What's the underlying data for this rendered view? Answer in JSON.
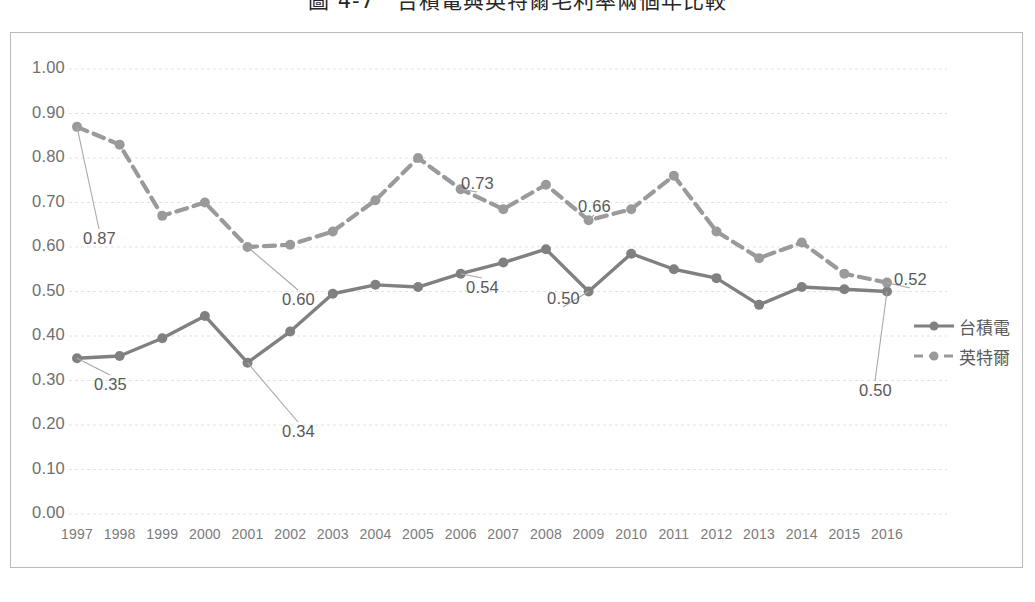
{
  "figure": {
    "title": "圖 4-7　台積電與英特爾毛利率兩個年比較"
  },
  "legend": {
    "position": "right",
    "items": [
      {
        "label": "台積電",
        "style": "solid",
        "color": "#808080"
      },
      {
        "label": "英特爾",
        "style": "dashed",
        "color": "#9a9a9a"
      }
    ]
  },
  "axes": {
    "y_ticks": [
      "1.00",
      "0.90",
      "0.80",
      "0.70",
      "0.60",
      "0.50",
      "0.40",
      "0.30",
      "0.20",
      "0.10",
      "0.00"
    ],
    "x_ticks": [
      "1997",
      "1998",
      "1999",
      "2000",
      "2001",
      "2002",
      "2003",
      "2004",
      "2005",
      "2006",
      "2007",
      "2008",
      "2009",
      "2010",
      "2011",
      "2012",
      "2013",
      "2014",
      "2015",
      "2016"
    ]
  },
  "annotations": [
    {
      "text": "0.87",
      "series": "英特爾",
      "year": "1997",
      "x": 72,
      "y": 196
    },
    {
      "text": "0.35",
      "series": "台積電",
      "year": "1997",
      "x": 83,
      "y": 342
    },
    {
      "text": "0.60",
      "series": "英特爾",
      "year": "2001",
      "x": 271,
      "y": 257
    },
    {
      "text": "0.34",
      "series": "台積電",
      "year": "2001",
      "x": 271,
      "y": 389
    },
    {
      "text": "0.73",
      "series": "英特爾",
      "year": "2006",
      "x": 450,
      "y": 141
    },
    {
      "text": "0.54",
      "series": "台積電",
      "year": "2006",
      "x": 455,
      "y": 245
    },
    {
      "text": "0.66",
      "series": "英特爾",
      "year": "2009",
      "x": 567,
      "y": 164
    },
    {
      "text": "0.50",
      "series": "台積電",
      "year": "2009",
      "x": 536,
      "y": 256
    },
    {
      "text": "0.52",
      "series": "英特爾",
      "year": "2016",
      "x": 883,
      "y": 237
    },
    {
      "text": "0.50",
      "series": "台積電",
      "year": "2016",
      "x": 848,
      "y": 348
    }
  ],
  "chart_data": {
    "type": "line",
    "title": "圖 4-7　台積電與英特爾毛利率兩個年比較",
    "xlabel": "",
    "ylabel": "",
    "ylim": [
      0.0,
      1.0
    ],
    "ytick_step": 0.1,
    "grid": true,
    "legend_position": "right",
    "categories": [
      "1997",
      "1998",
      "1999",
      "2000",
      "2001",
      "2002",
      "2003",
      "2004",
      "2005",
      "2006",
      "2007",
      "2008",
      "2009",
      "2010",
      "2011",
      "2012",
      "2013",
      "2014",
      "2015",
      "2016"
    ],
    "series": [
      {
        "name": "台積電",
        "style": "solid",
        "color": "#808080",
        "values": [
          0.35,
          0.355,
          0.395,
          0.445,
          0.34,
          0.41,
          0.495,
          0.515,
          0.51,
          0.54,
          0.565,
          0.595,
          0.5,
          0.585,
          0.55,
          0.53,
          0.47,
          0.51,
          0.505,
          0.5
        ]
      },
      {
        "name": "英特爾",
        "style": "dashed",
        "color": "#9a9a9a",
        "values": [
          0.87,
          0.83,
          0.67,
          0.7,
          0.6,
          0.605,
          0.635,
          0.705,
          0.8,
          0.73,
          0.685,
          0.74,
          0.66,
          0.685,
          0.76,
          0.635,
          0.575,
          0.61,
          0.54,
          0.52
        ]
      }
    ]
  }
}
